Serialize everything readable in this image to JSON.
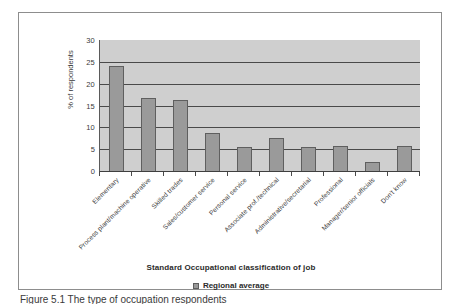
{
  "chart_data": {
    "type": "bar",
    "title": "",
    "xlabel": "Standard Occupational classification of job",
    "ylabel": "% of respondents",
    "ylim": [
      0,
      30
    ],
    "yticks": [
      0,
      5,
      10,
      15,
      20,
      25,
      30
    ],
    "grid": true,
    "legend_position": "bottom",
    "categories": [
      "Elementary",
      "Process plant/machine operative",
      "Skilled trades",
      "Sales/customer service",
      "Personal service",
      "Associate prof./technical",
      "Administrative/secretarial",
      "Professional",
      "Manager/senior officials",
      "Don't know"
    ],
    "series": [
      {
        "name": "Regional average",
        "color": "#9a9a9a",
        "values": [
          24.0,
          16.8,
          16.2,
          8.8,
          5.4,
          7.6,
          5.4,
          5.7,
          2.0,
          5.7
        ]
      }
    ]
  },
  "caption": {
    "text": "Figure 5.1 The type of occupation respondents"
  }
}
